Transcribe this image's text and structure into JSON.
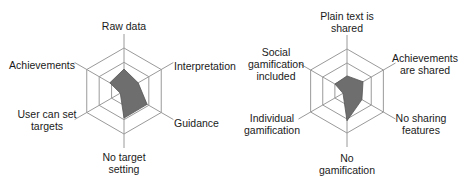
{
  "chart_data": [
    {
      "type": "radar",
      "title": "",
      "rings": 3,
      "grid": true,
      "axes": [
        "Raw data",
        "Interpretation",
        "Guidance",
        "No target setting",
        "User can set targets",
        "Achievements"
      ],
      "series": [
        {
          "name": "",
          "values": [
            0.51,
            0.38,
            0.62,
            0.63,
            0.1,
            0.38
          ],
          "color": "#6e6e6e"
        }
      ],
      "range": [
        0,
        1
      ]
    },
    {
      "type": "radar",
      "title": "",
      "rings": 3,
      "grid": true,
      "axes": [
        "Plain text is shared",
        "Achievements are shared",
        "No sharing features",
        "No gamification",
        "Individual gamification",
        "Social gamification included"
      ],
      "series": [
        {
          "name": "",
          "values": [
            0.36,
            0.44,
            0.41,
            0.71,
            0.11,
            0.33
          ],
          "color": "#6e6e6e"
        }
      ],
      "range": [
        0,
        1
      ]
    }
  ],
  "labels": {
    "left": {
      "top": [
        "Raw data"
      ],
      "upper_right": [
        "Interpretation"
      ],
      "lower_right": [
        "Guidance"
      ],
      "bottom": [
        "No target",
        "setting"
      ],
      "lower_left": [
        "User can set",
        "targets"
      ],
      "upper_left": [
        "Achievements"
      ]
    },
    "right": {
      "top": [
        "Plain text is",
        "shared"
      ],
      "upper_right": [
        "Achievements",
        "are shared"
      ],
      "lower_right": [
        "No sharing",
        "features"
      ],
      "bottom": [
        "No",
        "gamification"
      ],
      "lower_left": [
        "Individual",
        "gamification"
      ],
      "upper_left": [
        "Social",
        "gamification",
        "included"
      ]
    }
  },
  "colors": {
    "grid": "#9a9a9a",
    "fill": "#6e6e6e",
    "text": "#1a1a1a"
  }
}
